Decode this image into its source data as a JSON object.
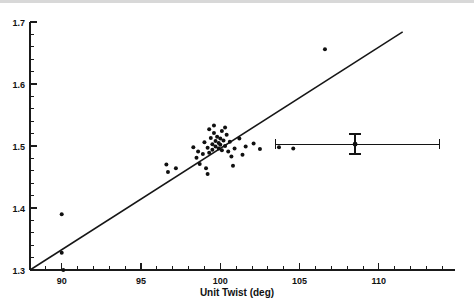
{
  "chart_data": {
    "type": "scatter",
    "title": "",
    "xlabel": "Unit Twist (deg)",
    "ylabel": "",
    "xlim": [
      88.0,
      114.8
    ],
    "ylim": [
      1.3,
      1.7
    ],
    "grid": false,
    "legend": "none",
    "x_ticks_major": [
      90,
      95,
      100,
      105,
      110
    ],
    "x_tick_labels": [
      "90",
      "95",
      "100",
      "105",
      "110"
    ],
    "x_tick_minor_step": 1,
    "y_ticks_major": [
      1.3,
      1.4,
      1.5,
      1.6,
      1.7
    ],
    "y_tick_labels": [
      "1.3",
      "1.4",
      "1.5",
      "1.6",
      "1.7"
    ],
    "y_tick_minor_step": 0.02,
    "points": [
      [
        90.0,
        1.39
      ],
      [
        90.0,
        1.328
      ],
      [
        90.1,
        1.3
      ],
      [
        96.6,
        1.47
      ],
      [
        96.7,
        1.458
      ],
      [
        97.2,
        1.464
      ],
      [
        98.5,
        1.481
      ],
      [
        98.7,
        1.471
      ],
      [
        99.2,
        1.455
      ],
      [
        98.3,
        1.498
      ],
      [
        98.6,
        1.491
      ],
      [
        98.9,
        1.487
      ],
      [
        99.0,
        1.506
      ],
      [
        99.2,
        1.497
      ],
      [
        99.3,
        1.489
      ],
      [
        99.4,
        1.513
      ],
      [
        99.5,
        1.503
      ],
      [
        99.5,
        1.494
      ],
      [
        99.6,
        1.521
      ],
      [
        99.7,
        1.508
      ],
      [
        99.7,
        1.499
      ],
      [
        99.8,
        1.515
      ],
      [
        99.9,
        1.505
      ],
      [
        99.9,
        1.496
      ],
      [
        100.0,
        1.512
      ],
      [
        100.0,
        1.502
      ],
      [
        100.1,
        1.524
      ],
      [
        100.1,
        1.493
      ],
      [
        100.2,
        1.509
      ],
      [
        100.3,
        1.5
      ],
      [
        100.4,
        1.518
      ],
      [
        100.5,
        1.491
      ],
      [
        100.6,
        1.507
      ],
      [
        100.7,
        1.483
      ],
      [
        100.9,
        1.496
      ],
      [
        101.2,
        1.512
      ],
      [
        101.4,
        1.486
      ],
      [
        101.6,
        1.499
      ],
      [
        102.1,
        1.504
      ],
      [
        102.5,
        1.495
      ],
      [
        99.3,
        1.527
      ],
      [
        99.6,
        1.533
      ],
      [
        100.3,
        1.53
      ],
      [
        100.8,
        1.468
      ],
      [
        99.1,
        1.464
      ],
      [
        103.7,
        1.498
      ],
      [
        104.6,
        1.496
      ],
      [
        106.6,
        1.656
      ]
    ],
    "fit_line": {
      "x_start": 88.0,
      "y_start": 1.3,
      "x_end": 111.5,
      "y_end": 1.684,
      "style": "solid"
    },
    "error_bar": {
      "x_center": 108.5,
      "y_center": 1.503,
      "x_low": 103.5,
      "x_high": 113.8,
      "y_low": 1.487,
      "y_high": 1.519
    }
  }
}
